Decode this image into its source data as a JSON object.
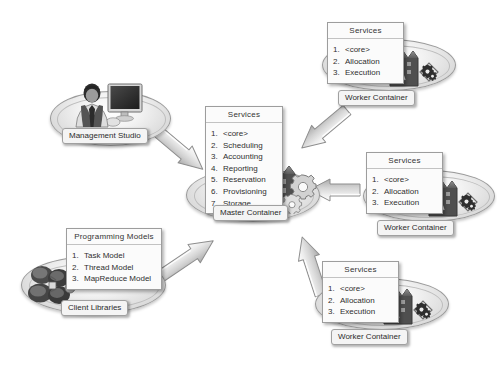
{
  "diagram": {
    "background_color": "#ffffff",
    "accent_color": "#8a8a8a"
  },
  "nodes": {
    "management_studio": {
      "label": "Management Studio",
      "icon": "user-and-monitor-icon",
      "platform": "ellipse-platform"
    },
    "client_libraries": {
      "label": "Client Libraries",
      "icon": "computer-cluster-icon",
      "platform": "ellipse-platform",
      "card": {
        "title": "Programming Models",
        "items": [
          {
            "num": "1.",
            "text": "Task Model"
          },
          {
            "num": "2.",
            "text": "Thread Model"
          },
          {
            "num": "3.",
            "text": "MapReduce Model"
          }
        ]
      }
    },
    "master_container": {
      "label": "Master Container",
      "icon": "factory-gears-icon",
      "platform": "ellipse-platform",
      "card": {
        "title": "Services",
        "items": [
          {
            "num": "1.",
            "text": "<core>"
          },
          {
            "num": "2.",
            "text": "Scheduling"
          },
          {
            "num": "3.",
            "text": "Accounting"
          },
          {
            "num": "4.",
            "text": "Reporting"
          },
          {
            "num": "5.",
            "text": "Reservation"
          },
          {
            "num": "6.",
            "text": "Provisioning"
          },
          {
            "num": "7.",
            "text": "Storage"
          }
        ]
      }
    },
    "worker_top": {
      "label": "Worker Container",
      "icon": "factory-gear-badge-icon",
      "platform": "ellipse-platform",
      "card": {
        "title": "Services",
        "items": [
          {
            "num": "1.",
            "text": "<core>"
          },
          {
            "num": "2.",
            "text": "Allocation"
          },
          {
            "num": "3.",
            "text": "Execution"
          }
        ]
      }
    },
    "worker_middle": {
      "label": "Worker Container",
      "icon": "factory-gear-badge-icon",
      "platform": "ellipse-platform",
      "card": {
        "title": "Services",
        "items": [
          {
            "num": "1.",
            "text": "<core>"
          },
          {
            "num": "2.",
            "text": "Allocation"
          },
          {
            "num": "3.",
            "text": "Execution"
          }
        ]
      }
    },
    "worker_bottom": {
      "label": "Worker Container",
      "icon": "factory-gear-badge-icon",
      "platform": "ellipse-platform",
      "card": {
        "title": "Services",
        "items": [
          {
            "num": "1.",
            "text": "<core>"
          },
          {
            "num": "2.",
            "text": "Allocation"
          },
          {
            "num": "3.",
            "text": "Execution"
          }
        ]
      }
    }
  },
  "connections": [
    {
      "name": "management-studio-to-master",
      "from": "management_studio",
      "to": "master_container",
      "direction": "down-right"
    },
    {
      "name": "client-libraries-to-master",
      "from": "client_libraries",
      "to": "master_container",
      "direction": "up-right"
    },
    {
      "name": "worker-top-to-master",
      "from": "worker_top",
      "to": "master_container",
      "direction": "down-left"
    },
    {
      "name": "worker-middle-to-master",
      "from": "worker_middle",
      "to": "master_container",
      "direction": "left"
    },
    {
      "name": "worker-bottom-to-master",
      "from": "worker_bottom",
      "to": "master_container",
      "direction": "up-left"
    }
  ]
}
